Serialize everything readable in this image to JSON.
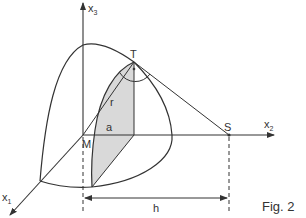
{
  "figure": {
    "caption": "Fig. 2",
    "colors": {
      "stroke": "#333333",
      "axis": "#555555",
      "shading": "#d9d9d9",
      "background": "#ffffff"
    }
  },
  "axes": {
    "x1": {
      "label": "x",
      "subscript": "1"
    },
    "x2": {
      "label": "x",
      "subscript": "2"
    },
    "x3": {
      "label": "x",
      "subscript": "3"
    }
  },
  "points": {
    "origin": "M",
    "tangent_point": "T",
    "external_point": "S"
  },
  "segments": {
    "radius": "r",
    "cross_section_radius": "a",
    "distance": "h"
  }
}
